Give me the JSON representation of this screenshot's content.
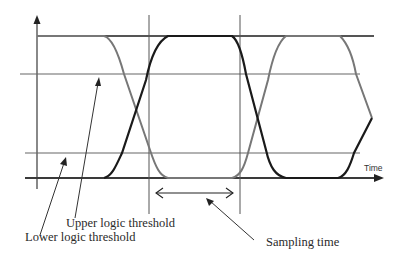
{
  "diagram": {
    "labels": {
      "time_axis": "Time",
      "upper_threshold": "Upper logic threshold",
      "lower_threshold": "Lower logic threshold",
      "sampling_time": "Sampling time"
    },
    "levels": {
      "high_rail_y": 36,
      "upper_threshold_y": 74,
      "lower_threshold_y": 153,
      "low_rail_y": 178
    },
    "sampling_window": {
      "left_x": 149,
      "right_x": 240
    },
    "colors": {
      "axis": "#3a3a3a",
      "rail": "#555555",
      "threshold": "#666666",
      "signal_dark": "#1a1a1a",
      "signal_gray": "#777777",
      "text": "#2a2a2a"
    }
  }
}
